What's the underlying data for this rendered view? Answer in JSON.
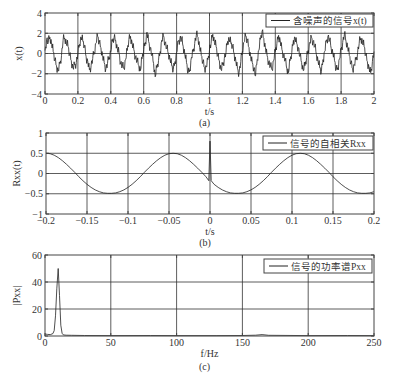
{
  "chart_data": [
    {
      "id": "a",
      "type": "line",
      "title": "",
      "caption": "(a)",
      "xlabel": "t/s",
      "ylabel": "x(t)",
      "xlim": [
        0,
        2
      ],
      "ylim": [
        -4,
        4
      ],
      "xticks": [
        0,
        0.2,
        0.4,
        0.6,
        0.8,
        1,
        1.2,
        1.4,
        1.6,
        1.8,
        2
      ],
      "xtick_labels": [
        "0",
        "0.2",
        "0.4",
        "0.6",
        "0.8",
        "1",
        "1.2",
        "1.4",
        "1.6",
        "1.8",
        "2"
      ],
      "yticks": [
        -4,
        -2,
        0,
        2,
        4
      ],
      "ytick_labels": [
        "−4",
        "−2",
        "0",
        "2",
        "4"
      ],
      "grid": true,
      "legend": {
        "position": "upper right",
        "entries": [
          "含噪声的信号x(t)"
        ]
      },
      "series": [
        {
          "name": "含噪声的信号x(t)",
          "x_start": 0,
          "x_step": 0.01,
          "values": [
            0.3,
            1.4,
            1.1,
            1.6,
            0.9,
            0.2,
            -0.6,
            -1.2,
            -1.7,
            -1.0,
            -0.2,
            1.3,
            1.5,
            1.0,
            0.7,
            -0.1,
            -0.7,
            -1.4,
            -1.1,
            -0.9,
            0.0,
            0.9,
            1.6,
            1.2,
            0.8,
            -0.3,
            -0.8,
            -1.6,
            -1.2,
            -0.5,
            0.1,
            1.0,
            1.7,
            1.1,
            0.6,
            -0.2,
            -0.9,
            -1.5,
            -1.0,
            -0.4,
            0.2,
            1.2,
            1.6,
            1.3,
            0.5,
            0.1,
            -0.9,
            -1.3,
            -1.5,
            -0.6,
            0.3,
            1.4,
            1.7,
            1.0,
            0.4,
            -0.3,
            -0.8,
            -1.2,
            -1.7,
            -0.5,
            0.4,
            1.1,
            2.1,
            1.2,
            0.6,
            -0.2,
            -1.0,
            -2.3,
            -1.4,
            -0.7,
            0.2,
            1.3,
            1.8,
            1.1,
            0.5,
            0.0,
            -0.6,
            -1.2,
            -1.6,
            -0.8,
            0.1,
            1.2,
            1.5,
            1.4,
            0.7,
            -0.1,
            -0.9,
            -1.9,
            -1.6,
            -0.4,
            0.2,
            1.0,
            1.8,
            1.6,
            0.6,
            -0.2,
            -0.8,
            -1.4,
            -1.3,
            -0.6,
            0.4,
            1.0,
            1.9,
            1.1,
            0.7,
            -0.2,
            -0.7,
            -1.6,
            -1.1,
            -0.5,
            0.1,
            1.2,
            1.4,
            1.0,
            0.8,
            0.0,
            -0.7,
            -1.5,
            -1.9,
            -0.8,
            0.2,
            1.1,
            1.7,
            1.3,
            0.6,
            -0.3,
            -0.9,
            -1.4,
            -2.2,
            -0.6,
            0.3,
            1.4,
            2.2,
            1.5,
            0.6,
            -0.2,
            -0.8,
            -1.3,
            -1.6,
            -0.7,
            0.2,
            1.0,
            1.8,
            1.3,
            0.4,
            -0.1,
            -0.7,
            -1.5,
            -1.9,
            -0.7,
            0.1,
            1.3,
            1.6,
            1.0,
            0.6,
            -0.3,
            -0.9,
            -1.7,
            -1.2,
            -0.4,
            0.3,
            1.1,
            1.6,
            1.2,
            0.7,
            -0.1,
            -0.8,
            -1.4,
            -1.8,
            -0.6,
            0.2,
            1.2,
            1.7,
            1.3,
            0.5,
            0.0,
            -0.7,
            -1.6,
            -1.4,
            -0.5,
            0.4,
            1.1,
            1.9,
            1.2,
            0.6,
            -0.2,
            -0.9,
            -1.5,
            -1.1,
            -0.6,
            0.1,
            1.0,
            1.5,
            1.1,
            0.7,
            -0.1,
            -0.8,
            -1.4,
            -1.9,
            -0.8,
            0.2,
            1.3,
            1.6,
            1.2,
            0.5,
            -0.3,
            -0.7,
            -1.5,
            -1.8,
            -0.6,
            0.4
          ]
        }
      ]
    },
    {
      "id": "b",
      "type": "line",
      "title": "",
      "caption": "(b)",
      "xlabel": "t/s",
      "ylabel": "Rxx(t)",
      "xlim": [
        -0.2,
        0.2
      ],
      "ylim": [
        -1,
        1
      ],
      "xticks": [
        -0.2,
        -0.15,
        -0.1,
        -0.05,
        0,
        0.05,
        0.1,
        0.15,
        0.2
      ],
      "xtick_labels": [
        "−0.2",
        "−0.15",
        "−0.1",
        "−0.05",
        "0",
        "0.05",
        "0.1",
        "0.15",
        "0.2"
      ],
      "yticks": [
        -1,
        -0.5,
        0,
        0.5,
        1
      ],
      "ytick_labels": [
        "−1",
        "−0.5",
        "0",
        "0.5",
        "1"
      ],
      "grid": true,
      "legend": {
        "position": "upper right",
        "entries": [
          "信号的自相关Rxx"
        ]
      },
      "series": [
        {
          "name": "信号的自相关Rxx",
          "x_start": -0.2,
          "x_step": 0.005,
          "values": [
            0.5,
            0.488,
            0.452,
            0.393,
            0.316,
            0.227,
            0.13,
            0.029,
            -0.078,
            -0.178,
            -0.267,
            -0.343,
            -0.404,
            -0.449,
            -0.478,
            -0.49,
            -0.49,
            -0.478,
            -0.449,
            -0.404,
            -0.343,
            -0.267,
            -0.178,
            -0.078,
            0.029,
            0.13,
            0.227,
            0.316,
            0.393,
            0.452,
            0.488,
            0.5,
            0.488,
            0.452,
            0.393,
            0.316,
            0.227,
            0.13,
            0.029,
            -0.078,
            -0.178,
            -0.267,
            -0.343,
            -0.404,
            -0.449,
            -0.478,
            -0.49,
            -0.49,
            -0.478,
            -0.449,
            -0.404,
            -0.343,
            -0.267,
            -0.178,
            -0.078,
            0.029,
            0.13,
            0.227,
            0.316,
            0.393,
            0.452,
            0.488,
            0.5,
            0.488,
            0.452,
            0.393,
            0.316,
            0.227,
            0.13,
            0.029,
            -0.078,
            -0.178,
            -0.267,
            -0.343,
            -0.404,
            -0.449,
            -0.478,
            -0.49,
            -0.49,
            -0.478,
            -0.449
          ],
          "note": "periodic 10 Hz cosine, amplitude ≈0.5, with a spike to ≈0.8 at t=0"
        }
      ],
      "spike": {
        "x": 0,
        "y": 0.8
      }
    },
    {
      "id": "c",
      "type": "line",
      "title": "",
      "caption": "(c)",
      "xlabel": "f/Hz",
      "ylabel": "|Pxx|",
      "xlim": [
        0,
        250
      ],
      "ylim": [
        0,
        60
      ],
      "xticks": [
        0,
        50,
        100,
        150,
        200,
        250
      ],
      "xtick_labels": [
        "0",
        "50",
        "100",
        "150",
        "200",
        "250"
      ],
      "yticks": [
        0,
        20,
        40,
        60
      ],
      "ytick_labels": [
        "0",
        "20",
        "40",
        "60"
      ],
      "grid": true,
      "legend": {
        "position": "upper right",
        "entries": [
          "信号的功率谱Pxx"
        ]
      },
      "series": [
        {
          "name": "信号的功率谱Pxx",
          "x": [
            0,
            2,
            4,
            6,
            7,
            8,
            9,
            10,
            11,
            12,
            13,
            14,
            16,
            20,
            30,
            50,
            80,
            100,
            130,
            150,
            160,
            165,
            170,
            200,
            230,
            250
          ],
          "values": [
            1.5,
            1.2,
            1.0,
            1.8,
            4,
            15,
            35,
            50,
            30,
            8,
            2,
            0.8,
            0.6,
            0.5,
            0.4,
            0.3,
            0.4,
            0.3,
            0.3,
            0.4,
            0.6,
            1.0,
            0.5,
            0.3,
            0.4,
            0.3
          ]
        }
      ]
    }
  ]
}
